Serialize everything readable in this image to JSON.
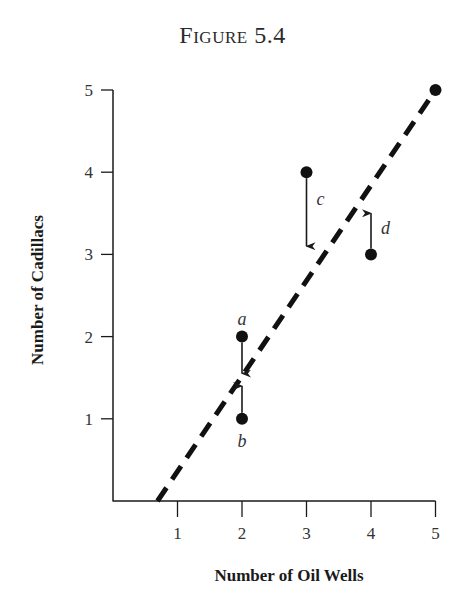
{
  "title": "Figure 5.4",
  "chart_data": {
    "type": "scatter",
    "title": "Figure 5.4",
    "xlabel": "Number of Oil Wells",
    "ylabel": "Number of Cadillacs",
    "xlim": [
      0,
      5
    ],
    "ylim": [
      0,
      5
    ],
    "xticks": [
      1,
      2,
      3,
      4,
      5
    ],
    "yticks": [
      1,
      2,
      3,
      4,
      5
    ],
    "grid": false,
    "points": [
      {
        "label": "a",
        "x": 2,
        "y": 2,
        "arrow_to_y": 1.55
      },
      {
        "label": "b",
        "x": 2,
        "y": 1,
        "arrow_to_y": 1.4
      },
      {
        "label": "c",
        "x": 3,
        "y": 4,
        "arrow_to_y": 3.1
      },
      {
        "label": "d",
        "x": 4,
        "y": 3,
        "arrow_to_y": 3.5
      },
      {
        "label": "",
        "x": 5,
        "y": 5,
        "arrow_to_y": null
      }
    ],
    "fit_line": {
      "style": "dashed",
      "x_start": 0.69,
      "y_start": 0,
      "x_end": 5,
      "y_end": 5
    }
  }
}
